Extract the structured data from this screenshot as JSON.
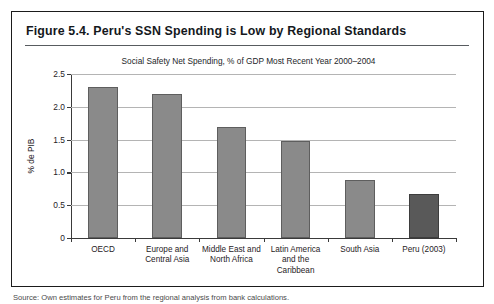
{
  "figure": {
    "title": "Figure 5.4.  Peru's SSN Spending is Low by Regional Standards",
    "source_note": "Source: Own estimates for Peru from the regional analysis from bank calculations."
  },
  "chart_data": {
    "type": "bar",
    "title": "Social Safety Net Spending, % of GDP Most Recent Year 2000–2004",
    "xlabel": "",
    "ylabel": "% de PIB",
    "categories": [
      "OECD",
      "Europe and Central Asia",
      "Middle East and North Africa",
      "Latin America and the Caribbean",
      "South Asia",
      "Peru (2003)"
    ],
    "category_lines": [
      [
        "OECD"
      ],
      [
        "Europe and",
        "Central Asia"
      ],
      [
        "Middle East and",
        "North Africa"
      ],
      [
        "Latin America",
        "and the",
        "Caribbean"
      ],
      [
        "South Asia"
      ],
      [
        "Peru (2003)"
      ]
    ],
    "values": [
      2.3,
      2.19,
      1.69,
      1.48,
      0.88,
      0.67
    ],
    "highlight_index": 5,
    "ylim": [
      0,
      2.5
    ],
    "yticks": [
      0,
      0.5,
      1.0,
      1.5,
      2.0,
      2.5
    ],
    "ytick_labels": [
      "0",
      "0.5",
      "1.0",
      "1.5",
      "2.0",
      "2.5"
    ],
    "grid": true,
    "legend": "none",
    "bar_color": "#8a8a8a",
    "highlight_color": "#595959"
  }
}
